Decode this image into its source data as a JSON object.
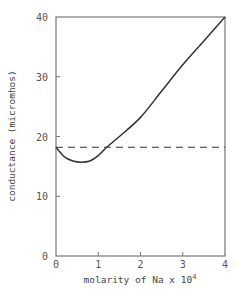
{
  "chart_data": {
    "type": "line",
    "title": "",
    "xlabel": "molarity of Na x 10",
    "xlabel_superscript": "4",
    "ylabel": "conductance (micromhos)",
    "xlim": [
      0,
      4
    ],
    "ylim": [
      0,
      40
    ],
    "xticks": [
      0,
      1,
      2,
      3,
      4
    ],
    "xtick_labels": [
      "0",
      "1",
      "2",
      "3",
      "4"
    ],
    "yticks": [
      0,
      10,
      20,
      30,
      40
    ],
    "ytick_labels": [
      "0",
      "10",
      "20",
      "30",
      "40"
    ],
    "grid": false,
    "series": [
      {
        "name": "conductance",
        "style": "solid",
        "color": "#333333",
        "x": [
          0,
          0.2,
          0.4,
          0.6,
          0.8,
          1.0,
          1.2,
          1.5,
          2.0,
          2.5,
          3.0,
          3.5,
          4.0
        ],
        "y": [
          18.2,
          16.6,
          15.9,
          15.7,
          15.9,
          16.8,
          18.2,
          20.0,
          23.2,
          27.6,
          32.0,
          36.0,
          40.0
        ]
      },
      {
        "name": "reference",
        "style": "dashed",
        "color": "#333333",
        "x": [
          0,
          4
        ],
        "y": [
          18.2,
          18.2
        ]
      }
    ]
  }
}
